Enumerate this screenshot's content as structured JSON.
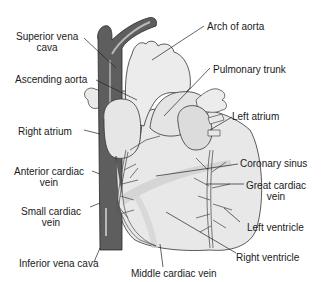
{
  "diagram": {
    "colors": {
      "vena_cava": "#5e5e5e",
      "vena_cava_highlight": "#b8b8b8",
      "heart_fill": "#e8e8e8",
      "heart_shade": "#cfcfcf",
      "outline": "#333333",
      "vein": "#555555",
      "leader_line": "#222222",
      "text": "#1a1a1a",
      "background": "#ffffff"
    },
    "labels": {
      "superior_vena_cava": [
        "Superior vena",
        "cava"
      ],
      "ascending_aorta": "Ascending aorta",
      "right_atrium": "Right atrium",
      "anterior_cardiac_vein": [
        "Anterior cardiac",
        "vein"
      ],
      "small_cardiac_vein": [
        "Small cardiac",
        "vein"
      ],
      "inferior_vena_cava": "Inferior vena cava",
      "arch_of_aorta": "Arch of aorta",
      "pulmonary_trunk": "Pulmonary trunk",
      "left_atrium": "Left atrium",
      "coronary_sinus": "Coronary sinus",
      "great_cardiac_vein": [
        "Great cardiac",
        "vein"
      ],
      "left_ventricle": "Left ventricle",
      "right_ventricle": "Right ventricle",
      "middle_cardiac_vein": "Middle cardiac vein"
    }
  }
}
